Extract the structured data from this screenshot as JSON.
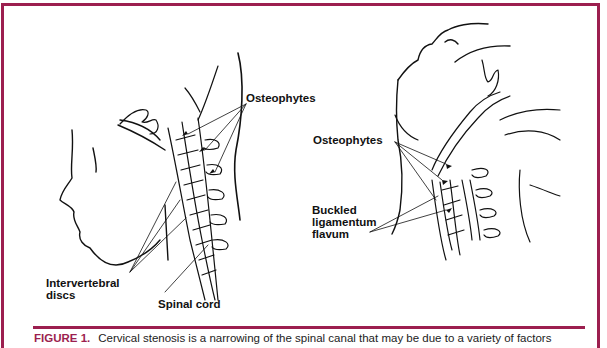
{
  "figure": {
    "border_color": "#9c1f4f",
    "left_illustration": {
      "labels": {
        "osteophytes": "Osteophytes",
        "intervertebral_discs_line1": "Intervertebral",
        "intervertebral_discs_line2": "discs",
        "spinal_cord": "Spinal cord"
      }
    },
    "right_illustration": {
      "labels": {
        "osteophytes": "Osteophytes",
        "buckled_line1": "Buckled",
        "buckled_line2": "ligamentum",
        "buckled_line3": "flavum"
      }
    },
    "caption": {
      "label": "FIGURE 1.",
      "text": "Cervical stenosis is a narrowing of the spinal canal that may be due to a variety of factors"
    }
  }
}
